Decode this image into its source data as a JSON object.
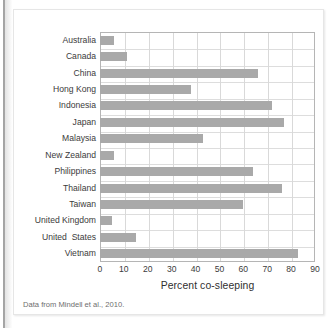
{
  "figure": {
    "caption": "Data from Mindell et al., 2010.",
    "colors": {
      "bar": "#a9a9a9",
      "gridline": "#d9d9d9",
      "axis": "#b5b5b5",
      "label_text": "#3b3b3b",
      "caption_text": "#6e6e6e"
    }
  },
  "chart_data": {
    "type": "bar",
    "orientation": "horizontal",
    "title": "",
    "xlabel": "Percent co-sleeping",
    "ylabel": "",
    "xlim": [
      0,
      90
    ],
    "xticks": [
      0,
      10,
      20,
      30,
      40,
      50,
      60,
      70,
      80,
      90
    ],
    "grid": true,
    "legend": null,
    "categories": [
      "Australia",
      "Canada",
      "China",
      "Hong Kong",
      "Indonesia",
      "Japan",
      "Malaysia",
      "New Zealand",
      "Philippines",
      "Thailand",
      "Taiwan",
      "United Kingdom",
      "United  States",
      "Vietnam"
    ],
    "values": [
      6,
      11.5,
      66,
      38,
      72,
      77,
      43,
      6,
      64,
      76,
      60,
      5,
      15,
      83
    ]
  }
}
